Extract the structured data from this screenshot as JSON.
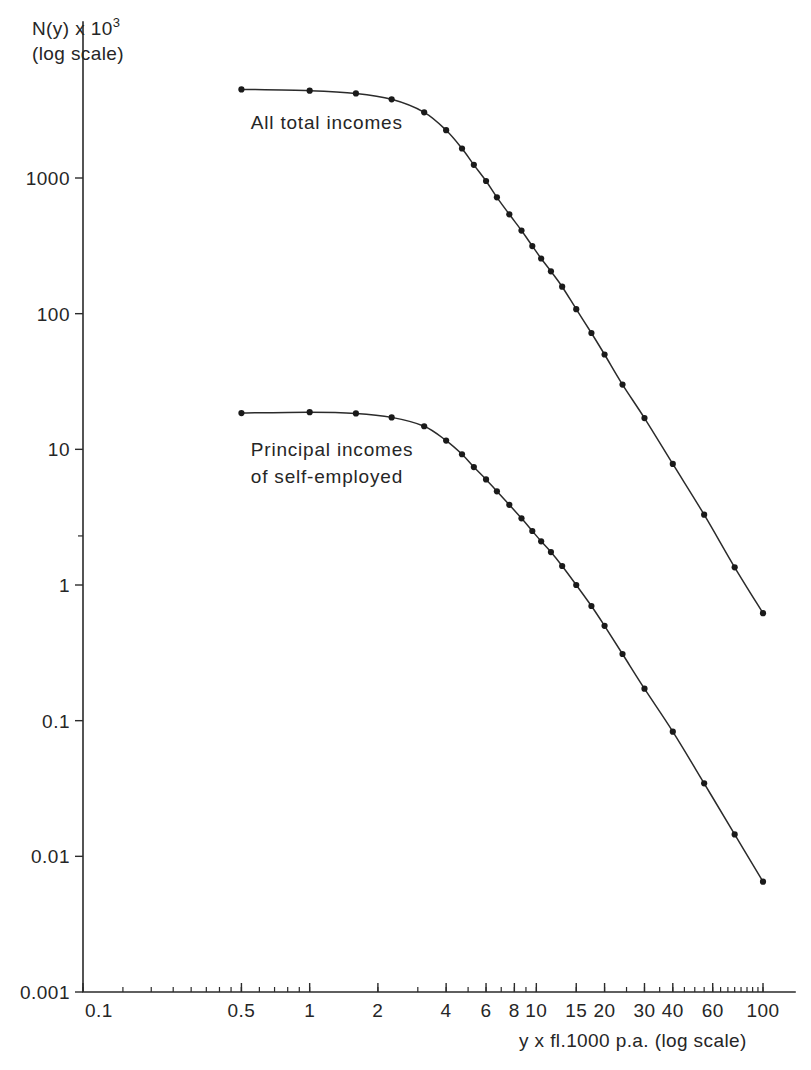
{
  "chart_data": {
    "type": "line",
    "title": "",
    "subtitle": "",
    "xlabel": "y x fl.1000 p.a. (log scale)",
    "ylabel_main": "N(y) x 10",
    "ylabel_exponent": "3",
    "ylabel_sub": "(log scale)",
    "xscale": "log",
    "yscale": "log",
    "xlim": [
      0.1,
      130
    ],
    "ylim": [
      0.001,
      10000
    ],
    "grid": false,
    "legend_position": "inline-annotation",
    "x_tick_labels": [
      "0.1",
      "0.5",
      "1",
      "2",
      "4",
      "6",
      "8",
      "10",
      "15",
      "20",
      "30",
      "40",
      "60",
      "100"
    ],
    "x_tick_values": [
      0.1,
      0.5,
      1,
      2,
      4,
      6,
      8,
      10,
      15,
      20,
      30,
      40,
      60,
      100
    ],
    "y_tick_labels": [
      "1000",
      "100",
      "10",
      "1",
      "0.1",
      "0.01",
      "0.001"
    ],
    "y_tick_values": [
      1000,
      100,
      10,
      1,
      0.1,
      0.01,
      0.001
    ],
    "annotations": [
      {
        "text_line1": "All total incomes",
        "text_line2": "",
        "x": 0.55,
        "y": 2300
      },
      {
        "text_line1": "Principal incomes",
        "text_line2": "of self-employed",
        "x": 0.55,
        "y": 9.0
      }
    ],
    "series": [
      {
        "name": "All total incomes",
        "label": "All total incomes",
        "marker": "filled-circle",
        "x": [
          0.5,
          1.0,
          1.6,
          2.3,
          3.2,
          4.0,
          4.7,
          5.3,
          6.0,
          6.7,
          7.6,
          8.6,
          9.6,
          10.5,
          11.6,
          13.0,
          15.0,
          17.5,
          20.0,
          24.0,
          30.0,
          40.0,
          55.0,
          75.0,
          100.0
        ],
        "y": [
          4500,
          4400,
          4200,
          3800,
          3050,
          2250,
          1650,
          1250,
          950,
          720,
          540,
          410,
          315,
          255,
          205,
          158,
          108,
          72,
          50,
          30,
          17,
          7.8,
          3.3,
          1.35,
          0.62
        ]
      },
      {
        "name": "Principal incomes of self-employed",
        "label": "Principal incomes of self-employed",
        "marker": "filled-circle",
        "x": [
          0.5,
          1.0,
          1.6,
          2.3,
          3.2,
          4.0,
          4.7,
          5.3,
          6.0,
          6.7,
          7.6,
          8.6,
          9.6,
          10.5,
          11.6,
          13.0,
          15.0,
          17.5,
          20.0,
          24.0,
          30.0,
          40.0,
          55.0,
          75.0,
          100.0
        ],
        "y": [
          18.5,
          18.8,
          18.4,
          17.2,
          14.8,
          11.6,
          9.2,
          7.4,
          6.0,
          4.9,
          3.9,
          3.1,
          2.5,
          2.1,
          1.75,
          1.38,
          1.0,
          0.7,
          0.5,
          0.31,
          0.172,
          0.083,
          0.0345,
          0.0145,
          0.0065
        ]
      }
    ]
  }
}
